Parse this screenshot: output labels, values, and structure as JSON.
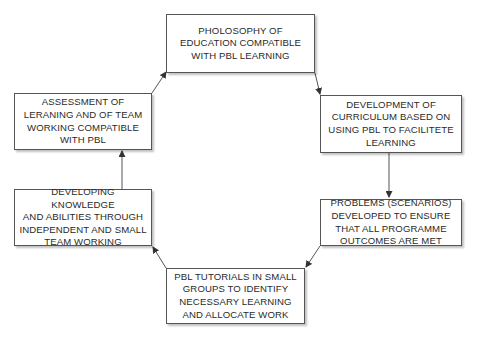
{
  "diagram": {
    "type": "cycle-flowchart",
    "colors": {
      "box_border": "#555555",
      "text": "#2a2a2a",
      "arrow": "#444444",
      "background": "#ffffff"
    },
    "nodes": [
      {
        "id": "philosophy",
        "label": "PHOLOSOPHY OF\nEDUCATION COMPATIBLE\nWITH PBL LEARNING"
      },
      {
        "id": "curriculum",
        "label": "DEVELOPMENT OF\nCURRICULUM BASED ON\nUSING PBL TO FACILITETE\nLEARNING"
      },
      {
        "id": "problems",
        "label": "PROBLEMS (SCENARIOS)\nDEVELOPED TO ENSURE\nTHAT ALL PROGRAMME\nOUTCOMES ARE MET"
      },
      {
        "id": "tutorials",
        "label": "PBL TUTORIALS IN SMALL\nGROUPS TO IDENTIFY\nNECESSARY LEARNING\nAND ALLOCATE WORK"
      },
      {
        "id": "developing",
        "label": "DEVELOPING KNOWLEDGE\nAND ABILITIES THROUGH\nINDEPENDENT AND SMALL\nTEAM WORKING"
      },
      {
        "id": "assessment",
        "label": "ASSESSMENT OF\nLERANING AND OF TEAM\nWORKING COMPATIBLE\nWITH PBL"
      }
    ],
    "edges": [
      {
        "from": "philosophy",
        "to": "curriculum"
      },
      {
        "from": "curriculum",
        "to": "problems"
      },
      {
        "from": "problems",
        "to": "tutorials"
      },
      {
        "from": "tutorials",
        "to": "developing"
      },
      {
        "from": "developing",
        "to": "assessment"
      },
      {
        "from": "assessment",
        "to": "philosophy"
      }
    ]
  }
}
